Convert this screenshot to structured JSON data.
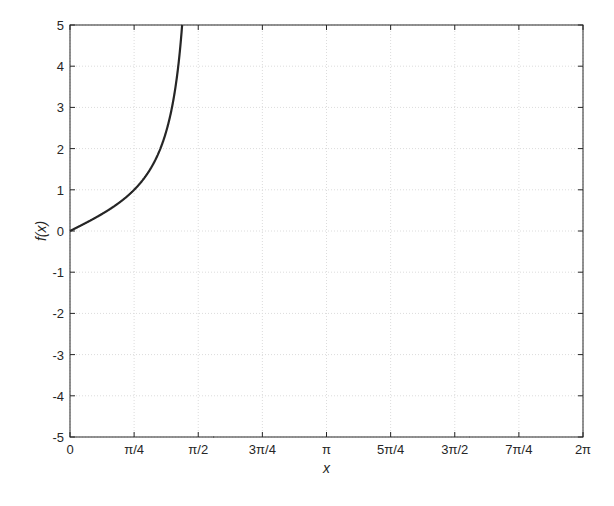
{
  "chart_data": {
    "type": "line",
    "title": "",
    "xlabel": "x",
    "ylabel": "f(x)",
    "function": "tan(x)",
    "xlim": [
      0,
      6.283185307
    ],
    "ylim": [
      -5,
      5
    ],
    "grid": true,
    "legend": null,
    "x_ticks": [
      0,
      0.785398,
      1.570796,
      2.356194,
      3.141593,
      3.926991,
      4.712389,
      5.497787,
      6.283185
    ],
    "x_tick_labels": [
      "0",
      "π/4",
      "π/2",
      "3π/4",
      "π",
      "5π/4",
      "3π/2",
      "7π/4",
      "2π"
    ],
    "y_ticks": [
      -5,
      -4,
      -3,
      -2,
      -1,
      0,
      1,
      2,
      3,
      4,
      5
    ],
    "y_tick_labels": [
      "-5",
      "-4",
      "-3",
      "-2",
      "-1",
      "0",
      "1",
      "2",
      "3",
      "4",
      "5"
    ],
    "series": [
      {
        "name": "f(x)",
        "color": "#262626",
        "x": [
          0,
          0.3927,
          0.7854,
          1.1781,
          1.3734,
          1.7682,
          1.9635,
          2.3562,
          2.7489,
          3.1416,
          3.5343,
          3.927,
          4.3197,
          4.515,
          4.9098,
          5.1051,
          5.4978,
          5.8905,
          6.2832
        ],
        "values": [
          0,
          0.414,
          1.0,
          2.414,
          5.0,
          -5.0,
          -2.414,
          -1.0,
          -0.414,
          0,
          0.414,
          1.0,
          2.414,
          5.0,
          -5.0,
          -2.414,
          -1.0,
          -0.414,
          0
        ]
      }
    ]
  },
  "colors": {
    "line": "#262626",
    "axes": "#262626",
    "grid": "#dcdcdc",
    "background": "#ffffff"
  }
}
